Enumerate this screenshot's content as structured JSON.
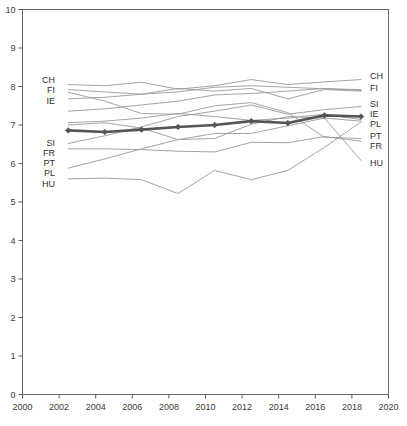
{
  "chart_data": {
    "type": "line",
    "title": "",
    "subtitle": "",
    "xlabel": "",
    "ylabel": "",
    "xlim": [
      2000,
      2020
    ],
    "ylim": [
      0,
      10
    ],
    "grid": false,
    "legend_position": "line-end-labels",
    "xticks": [
      "2000",
      "2002",
      "2004",
      "2006",
      "2008",
      "2010",
      "2012",
      "2014",
      "2016",
      "2018",
      "2020"
    ],
    "yticks": [
      "0",
      "1",
      "2",
      "3",
      "4",
      "5",
      "6",
      "7",
      "8",
      "9",
      "10"
    ],
    "x": [
      2002.5,
      2004.5,
      2006.5,
      2008.5,
      2010.5,
      2012.5,
      2014.5,
      2016.5,
      2018.5
    ],
    "highlight_series": "IE",
    "colors": {
      "highlight_line": "#555555",
      "other_line": "#9a9a9a",
      "axis": "#5a5a5a",
      "text": "#3b3b3b"
    },
    "series": [
      {
        "name": "CH",
        "label_left": "CH",
        "label_right": "CH",
        "highlight": false,
        "values": [
          8.05,
          8.02,
          8.11,
          7.93,
          8.02,
          8.18,
          8.05,
          8.12,
          8.18
        ]
      },
      {
        "name": "FI",
        "label_left": "FI",
        "label_right": "FI",
        "highlight": false,
        "values": [
          7.92,
          7.86,
          7.8,
          7.95,
          7.88,
          7.95,
          7.68,
          7.92,
          7.88
        ]
      },
      {
        "name": "SI",
        "label_left": "SI",
        "label_right": "SI",
        "highlight": false,
        "values": [
          6.52,
          6.72,
          6.95,
          7.22,
          7.36,
          7.52,
          7.28,
          7.4,
          7.48
        ]
      },
      {
        "name": "IE",
        "label_left": "IE",
        "label_right": "IE",
        "highlight": true,
        "values": [
          6.86,
          6.82,
          6.88,
          6.95,
          7.0,
          7.1,
          7.05,
          7.25,
          7.22
        ]
      },
      {
        "name": "PL",
        "label_left": "PL",
        "label_right": "PL",
        "highlight": false,
        "values": [
          5.6,
          5.62,
          5.58,
          5.22,
          5.82,
          5.58,
          5.82,
          6.42,
          7.08
        ]
      },
      {
        "name": "PT",
        "label_left": "PT",
        "label_right": "PT",
        "highlight": false,
        "values": [
          7.85,
          7.62,
          7.3,
          7.28,
          7.5,
          7.58,
          7.32,
          6.68,
          6.65
        ]
      },
      {
        "name": "FR",
        "label_left": "FR",
        "label_right": "FR",
        "highlight": false,
        "values": [
          6.38,
          6.38,
          6.36,
          6.32,
          6.3,
          6.55,
          6.54,
          6.7,
          6.58
        ]
      },
      {
        "name": "HU",
        "label_left": "HU",
        "label_right": "HU",
        "highlight": false,
        "values": [
          5.88,
          6.12,
          6.38,
          6.62,
          6.78,
          6.78,
          6.98,
          7.18,
          6.08
        ]
      },
      {
        "name": "S9",
        "label_left": "",
        "label_right": "",
        "highlight": false,
        "values": [
          7.68,
          7.72,
          7.8,
          7.86,
          7.98,
          8.02,
          7.98,
          7.94,
          7.92
        ]
      },
      {
        "name": "S10",
        "label_left": "",
        "label_right": "",
        "highlight": false,
        "values": [
          7.36,
          7.42,
          7.52,
          7.62,
          7.78,
          7.82,
          7.88,
          7.95,
          7.9
        ]
      },
      {
        "name": "S11",
        "label_left": "",
        "label_right": "",
        "highlight": false,
        "values": [
          7.06,
          7.1,
          7.18,
          7.3,
          7.22,
          7.12,
          7.18,
          7.28,
          7.14
        ]
      },
      {
        "name": "S12",
        "label_left": "",
        "label_right": "",
        "highlight": false,
        "values": [
          7.0,
          7.06,
          6.92,
          6.62,
          6.65,
          7.02,
          7.22,
          7.18,
          7.1
        ]
      }
    ],
    "left_labels": [
      "CH",
      "FI",
      "IE",
      "SI",
      "FR",
      "PT",
      "PL",
      "HU"
    ],
    "right_labels": [
      "CH",
      "FI",
      "SI",
      "IE",
      "PL",
      "PT",
      "FR",
      "HU"
    ]
  },
  "caption": {
    "text": ""
  }
}
